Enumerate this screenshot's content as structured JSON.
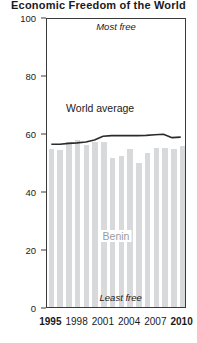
{
  "title": "Economic Freedom of the World",
  "chart_data": {
    "type": "bar",
    "title": "Economic Freedom of the World",
    "xlabel": "",
    "ylabel": "",
    "ylim": [
      0,
      100
    ],
    "xlim": [
      1995,
      2010
    ],
    "grid": false,
    "legend_position": "inline-annotation",
    "y_ticks": [
      "0",
      "20",
      "40",
      "60",
      "80",
      "100"
    ],
    "y_tick_values": [
      0,
      20,
      40,
      60,
      80,
      100
    ],
    "x_ticks": [
      "1995",
      "1998",
      "2001",
      "2004",
      "2007",
      "2010"
    ],
    "x_tick_values": [
      1995,
      1998,
      2001,
      2004,
      2007,
      2010
    ],
    "categories": [
      1995,
      1996,
      1997,
      1998,
      1999,
      2000,
      2001,
      2002,
      2003,
      2004,
      2005,
      2006,
      2007,
      2008,
      2009,
      2010
    ],
    "series": [
      {
        "name": "Benin",
        "type": "bar",
        "color": "#d8d9da",
        "values": [
          54.5,
          54.0,
          57.0,
          57.5,
          56.0,
          57.0,
          57.0,
          51.5,
          52.0,
          54.5,
          49.5,
          53.0,
          55.0,
          55.0,
          54.5,
          55.5
        ]
      },
      {
        "name": "World average",
        "type": "line",
        "color": "#2b2b2b",
        "values": [
          56.5,
          56.5,
          56.8,
          57.0,
          57.3,
          58.0,
          59.3,
          59.5,
          59.5,
          59.5,
          59.5,
          59.6,
          59.8,
          60.0,
          58.8,
          59.0
        ]
      }
    ],
    "annotations": [
      {
        "text": "Most free",
        "x": 2002.5,
        "y": 97,
        "style": "italic"
      },
      {
        "text": "Least free",
        "x": 2003.0,
        "y": 3.5,
        "style": "italic"
      },
      {
        "text": "World average",
        "x": 2000.8,
        "y": 69,
        "style": "plain"
      },
      {
        "text": "Benin",
        "x": 2002.5,
        "y": 25,
        "style": "plain"
      }
    ]
  },
  "axis": {
    "y_ticks": [
      {
        "label": "100",
        "value": 100
      },
      {
        "label": "80",
        "value": 80
      },
      {
        "label": "60",
        "value": 60
      },
      {
        "label": "40",
        "value": 40
      },
      {
        "label": "20",
        "value": 20
      },
      {
        "label": "0",
        "value": 0
      }
    ],
    "x_ticks": [
      {
        "label": "1995",
        "value": 1995,
        "bold": true
      },
      {
        "label": "1998",
        "value": 1998,
        "bold": false
      },
      {
        "label": "2001",
        "value": 2001,
        "bold": false
      },
      {
        "label": "2004",
        "value": 2004,
        "bold": false
      },
      {
        "label": "2007",
        "value": 2007,
        "bold": false
      },
      {
        "label": "2010",
        "value": 2010,
        "bold": true
      }
    ]
  },
  "colors": {
    "bar": "#d8d9da",
    "line": "#2b2b2b",
    "frame": "#3a3a3a",
    "text": "#1a1a1a",
    "muted_text": "#9b9b9b",
    "background": "#ffffff"
  }
}
